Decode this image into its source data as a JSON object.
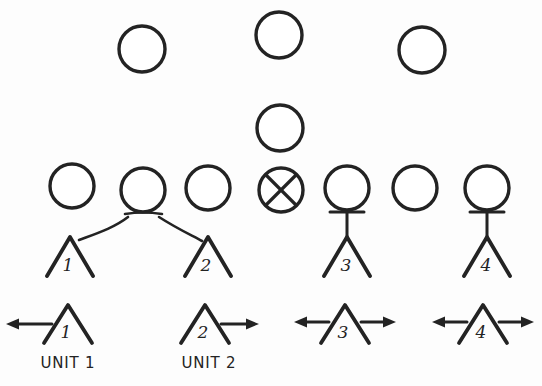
{
  "diagram": {
    "style": {
      "ink_color": "#232323",
      "paper_color": "#fdfdfd"
    },
    "top_nodes": [
      {
        "id": "top-node-1",
        "icon": "empty-circle",
        "cx": 142,
        "cy": 49,
        "r": 23
      },
      {
        "id": "top-node-2",
        "icon": "empty-circle",
        "cx": 279,
        "cy": 35,
        "r": 23
      },
      {
        "id": "top-node-3",
        "icon": "empty-circle",
        "cx": 422,
        "cy": 50,
        "r": 23
      }
    ],
    "mid_nodes": [
      {
        "id": "mid-node-1",
        "icon": "empty-circle",
        "cx": 280,
        "cy": 128,
        "r": 23
      }
    ],
    "row_nodes": [
      {
        "id": "row-node-1",
        "icon": "empty-circle",
        "cx": 72,
        "cy": 186,
        "r": 22,
        "crossed": false,
        "stem": "none"
      },
      {
        "id": "row-node-2",
        "icon": "empty-circle",
        "cx": 143,
        "cy": 190,
        "r": 22,
        "crossed": false,
        "stem": "fork"
      },
      {
        "id": "row-node-3",
        "icon": "empty-circle",
        "cx": 208,
        "cy": 188,
        "r": 22,
        "crossed": false,
        "stem": "none"
      },
      {
        "id": "row-node-4",
        "icon": "crossed-circle",
        "cx": 281,
        "cy": 190,
        "r": 22,
        "crossed": true,
        "stem": "none"
      },
      {
        "id": "row-node-5",
        "icon": "empty-circle",
        "cx": 347,
        "cy": 188,
        "r": 22,
        "crossed": false,
        "stem": "tee"
      },
      {
        "id": "row-node-6",
        "icon": "empty-circle",
        "cx": 415,
        "cy": 188,
        "r": 22,
        "crossed": false,
        "stem": "none"
      },
      {
        "id": "row-node-7",
        "icon": "empty-circle",
        "cx": 487,
        "cy": 188,
        "r": 22,
        "crossed": false,
        "stem": "tee"
      }
    ],
    "tents_upper": [
      {
        "id": "tent-upper-1",
        "number": "1",
        "apex_x": 70,
        "apex_y": 237,
        "half_width": 23,
        "base_y": 275,
        "link": "curve-left"
      },
      {
        "id": "tent-upper-2",
        "number": "2",
        "apex_x": 208,
        "apex_y": 237,
        "half_width": 23,
        "base_y": 275,
        "link": "curve-right"
      },
      {
        "id": "tent-upper-3",
        "number": "3",
        "apex_x": 347,
        "apex_y": 237,
        "half_width": 23,
        "base_y": 275,
        "link": "vertical"
      },
      {
        "id": "tent-upper-4",
        "number": "4",
        "apex_x": 487,
        "apex_y": 237,
        "half_width": 23,
        "base_y": 275,
        "link": "vertical"
      }
    ],
    "tents_lower": [
      {
        "id": "tent-lower-1",
        "number": "1",
        "apex_x": 68,
        "apex_y": 305,
        "half_width": 24,
        "base_y": 342,
        "arrow_left": true,
        "arrow_right": false,
        "unit_label": "UNIT 1",
        "label_x": 68,
        "label_y": 363
      },
      {
        "id": "tent-lower-2",
        "number": "2",
        "apex_x": 205,
        "apex_y": 305,
        "half_width": 24,
        "base_y": 342,
        "arrow_left": false,
        "arrow_right": true,
        "unit_label": "UNIT 2",
        "label_x": 209,
        "label_y": 363
      },
      {
        "id": "tent-lower-3",
        "number": "3",
        "apex_x": 345,
        "apex_y": 305,
        "half_width": 24,
        "base_y": 342,
        "arrow_left": true,
        "arrow_right": true,
        "unit_label": "",
        "label_x": 345,
        "label_y": 363
      },
      {
        "id": "tent-lower-4",
        "number": "4",
        "apex_x": 483,
        "apex_y": 305,
        "half_width": 24,
        "base_y": 342,
        "arrow_left": true,
        "arrow_right": true,
        "unit_label": "",
        "label_x": 483,
        "label_y": 363
      }
    ],
    "connector_curves": [
      {
        "id": "connector-node2-to-tent1",
        "from": "row-node-2",
        "to": "tent-upper-1",
        "path": "M 128 218 C 112 226, 90 232, 75 240"
      },
      {
        "id": "connector-node2-to-tent2",
        "from": "row-node-2",
        "to": "tent-upper-2",
        "path": "M 158 218 C 175 226, 192 232, 204 240"
      }
    ],
    "fork_bar": {
      "id": "fork-bar-node2",
      "path": "M 126 215 L 161 215"
    },
    "tee_stems": [
      {
        "id": "tee-stem-node5",
        "x": 347,
        "top_y": 212,
        "bottom_y": 234,
        "bar_half": 17,
        "bar_y": 212
      },
      {
        "id": "tee-stem-node7",
        "x": 487,
        "top_y": 212,
        "bottom_y": 234,
        "bar_half": 17,
        "bar_y": 212
      }
    ],
    "arrow_geometry": {
      "shaft_length": 36,
      "head_length": 11,
      "head_half_width": 6,
      "y_offset_from_apex": 24
    }
  }
}
